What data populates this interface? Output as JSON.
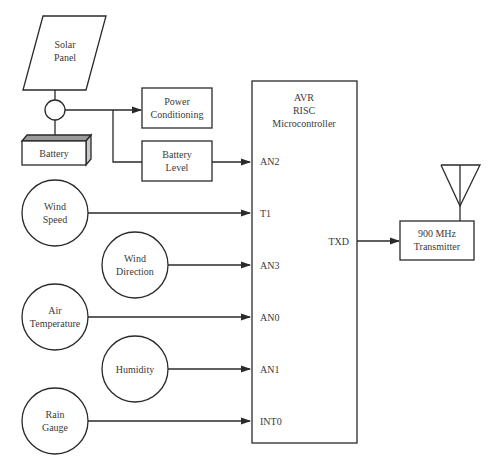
{
  "diagram": {
    "power": {
      "solar_panel": [
        "Solar",
        "Panel"
      ],
      "battery": "Battery",
      "power_conditioning": [
        "Power",
        "Conditioning"
      ],
      "battery_level": [
        "Battery",
        "Level"
      ]
    },
    "microcontroller": {
      "label": [
        "AVR",
        "RISC",
        "Microcontroller"
      ],
      "pins": {
        "an2": "AN2",
        "t1": "T1",
        "an3": "AN3",
        "an0": "AN0",
        "an1": "AN1",
        "int0": "INT0",
        "txd": "TXD"
      }
    },
    "sensors": {
      "wind_speed": [
        "Wind",
        "Speed"
      ],
      "wind_direction": [
        "Wind",
        "Direction"
      ],
      "air_temperature": [
        "Air",
        "Temperature"
      ],
      "humidity": "Humidity",
      "rain_gauge": [
        "Rain",
        "Gauge"
      ]
    },
    "transmitter": [
      "900 MHz",
      "Transmitter"
    ],
    "connections": [
      {
        "from": "Solar Panel",
        "to": "Junction"
      },
      {
        "from": "Junction",
        "to": "Battery"
      },
      {
        "from": "Junction",
        "to": "Power Conditioning"
      },
      {
        "from": "Junction",
        "to": "Battery Level"
      },
      {
        "from": "Battery Level",
        "to": "AN2"
      },
      {
        "from": "Wind Speed",
        "to": "T1"
      },
      {
        "from": "Wind Direction",
        "to": "AN3"
      },
      {
        "from": "Air Temperature",
        "to": "AN0"
      },
      {
        "from": "Humidity",
        "to": "AN1"
      },
      {
        "from": "Rain Gauge",
        "to": "INT0"
      },
      {
        "from": "TXD",
        "to": "900 MHz Transmitter"
      }
    ],
    "colors": {
      "line": "#2a2a2a",
      "text": "#3a3a3a",
      "battery_top": "#9a9a9a",
      "battery_side": "#c8c8c8",
      "background": "#ffffff"
    }
  }
}
